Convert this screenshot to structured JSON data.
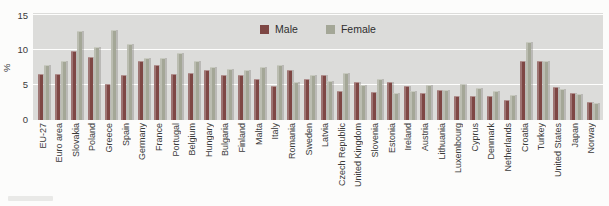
{
  "chart_data": {
    "type": "bar",
    "title": "",
    "ylabel": "%",
    "ylim": [
      0,
      15
    ],
    "yticks": [
      "0",
      "5",
      "10",
      "15"
    ],
    "grid": true,
    "legend_position": "top-center-inside",
    "plot_background": "#dcdcda",
    "categories": [
      "EU-27",
      "Euro area",
      "Slovakia",
      "Poland",
      "Greece",
      "Spain",
      "Germany",
      "France",
      "Portugal",
      "Belgium",
      "Hungary",
      "Bulgaria",
      "Finland",
      "Malta",
      "Italy",
      "Romania",
      "Sweden",
      "Latvia",
      "Czech Republic",
      "United Kingdom",
      "Slovenia",
      "Estonia",
      "Ireland",
      "Austria",
      "Lithuania",
      "Luxembourg",
      "Cyprus",
      "Denmark",
      "Netherlands",
      "Croatia",
      "Turkey",
      "United States",
      "Japan",
      "Norway"
    ],
    "series": [
      {
        "name": "Male",
        "color": "#7e4744",
        "values": [
          6.6,
          6.6,
          9.9,
          9.0,
          5.2,
          6.4,
          8.5,
          7.8,
          6.6,
          6.7,
          7.1,
          6.5,
          6.5,
          5.8,
          4.9,
          7.2,
          5.8,
          6.4,
          4.2,
          5.5,
          4.0,
          5.4,
          4.9,
          3.9,
          4.3,
          3.4,
          3.4,
          3.5,
          2.8,
          8.4,
          8.5,
          4.7,
          3.9,
          2.6
        ]
      },
      {
        "name": "Female",
        "color": "#a4a797",
        "values": [
          7.8,
          8.5,
          12.7,
          10.4,
          12.8,
          10.9,
          8.8,
          8.9,
          9.6,
          8.4,
          7.6,
          7.3,
          7.2,
          7.6,
          7.9,
          5.4,
          6.4,
          5.6,
          6.7,
          5.0,
          5.9,
          3.9,
          4.2,
          5.0,
          4.3,
          5.1,
          4.6,
          4.2,
          3.6,
          11.2,
          8.5,
          4.5,
          3.7,
          2.5
        ]
      }
    ]
  }
}
